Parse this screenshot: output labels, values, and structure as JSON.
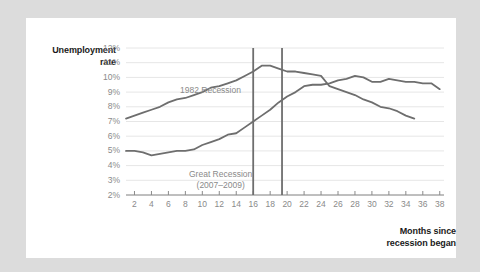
{
  "figure": {
    "background_color": "#dcdcdc",
    "card_color": "#ffffff",
    "y_axis_title_line1": "Unemployment",
    "y_axis_title_line2": "rate",
    "x_axis_title_line1": "Months since",
    "x_axis_title_line2": "recession began",
    "series_label_1982": "1982 Recession",
    "series_label_great_line1": "Great Recession",
    "series_label_great_line2": "(2007–2009)",
    "line_color": "#6e6e6e",
    "marker_line_color": "#6e6e6e",
    "grid_color": "#e6e6e6",
    "tick_color": "#8a8a8a"
  },
  "chart_data": {
    "type": "line",
    "title": "",
    "subtitle": "",
    "xlabel": "Months since recession began",
    "ylabel": "Unemployment rate",
    "xlim": [
      1,
      38.5
    ],
    "ylim": [
      2,
      12
    ],
    "grid": true,
    "legend": "inline-annotations",
    "ytick_labels": [
      "12%",
      "11%",
      "10%",
      "9%",
      "8%",
      "7%",
      "6%",
      "5%",
      "4%",
      "3%",
      "2%"
    ],
    "ytick_values": [
      12,
      11,
      10,
      9,
      8,
      7,
      6,
      5,
      4,
      3,
      2
    ],
    "xtick_labels": [
      "2",
      "4",
      "6",
      "8",
      "10",
      "12",
      "14",
      "16",
      "18",
      "20",
      "22",
      "24",
      "26",
      "28",
      "30",
      "32",
      "34",
      "36",
      "38"
    ],
    "xtick_values": [
      2,
      4,
      6,
      8,
      10,
      12,
      14,
      16,
      18,
      20,
      22,
      24,
      26,
      28,
      30,
      32,
      34,
      36,
      38
    ],
    "annotations": [
      {
        "name": "recession-end-marker-1982",
        "type": "vline",
        "x": 16,
        "label": ""
      },
      {
        "name": "recession-end-marker-great",
        "type": "vline",
        "x": 19.4,
        "label": ""
      }
    ],
    "series": [
      {
        "name": "1982 Recession",
        "color": "#6e6e6e",
        "x": [
          1,
          2,
          3,
          4,
          5,
          6,
          7,
          8,
          9,
          10,
          11,
          12,
          13,
          14,
          15,
          16,
          17,
          18,
          19,
          20,
          21,
          22,
          23,
          24,
          25,
          26,
          27,
          28,
          29,
          30,
          31,
          32,
          33,
          34,
          35
        ],
        "values": [
          7.2,
          7.4,
          7.6,
          7.8,
          8.0,
          8.3,
          8.5,
          8.6,
          8.8,
          9.0,
          9.3,
          9.4,
          9.6,
          9.8,
          10.1,
          10.4,
          10.8,
          10.8,
          10.6,
          10.4,
          10.4,
          10.3,
          10.2,
          10.1,
          9.4,
          9.2,
          9.0,
          8.8,
          8.5,
          8.3,
          8.0,
          7.9,
          7.7,
          7.4,
          7.2
        ]
      },
      {
        "name": "Great Recession (2007–2009)",
        "color": "#6e6e6e",
        "x": [
          1,
          2,
          3,
          4,
          5,
          6,
          7,
          8,
          9,
          10,
          11,
          12,
          13,
          14,
          15,
          16,
          17,
          18,
          19,
          20,
          21,
          22,
          23,
          24,
          25,
          26,
          27,
          28,
          29,
          30,
          31,
          32,
          33,
          34,
          35,
          36,
          37,
          38
        ],
        "values": [
          5.0,
          5.0,
          4.9,
          4.7,
          4.8,
          4.9,
          5.0,
          5.0,
          5.1,
          5.4,
          5.6,
          5.8,
          6.1,
          6.2,
          6.6,
          7.0,
          7.4,
          7.8,
          8.3,
          8.7,
          9.0,
          9.4,
          9.5,
          9.5,
          9.6,
          9.8,
          9.9,
          10.1,
          10.0,
          9.7,
          9.7,
          9.9,
          9.8,
          9.7,
          9.7,
          9.6,
          9.6,
          9.2
        ]
      }
    ]
  }
}
